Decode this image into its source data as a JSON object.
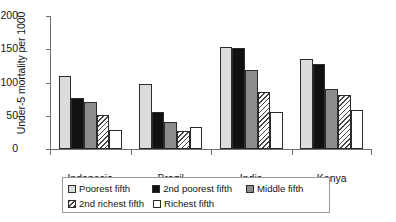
{
  "chart_data": {
    "type": "bar",
    "title": "",
    "xlabel": "",
    "ylabel": "Under-5 mortality per 1000",
    "ylim": [
      0,
      200
    ],
    "yticks": [
      0,
      50,
      100,
      150,
      200
    ],
    "ytick_labels": [
      "0",
      "50",
      "100",
      "150",
      "200"
    ],
    "grid": false,
    "legend_position": "bottom",
    "categories": [
      "Indonesia",
      "Brazil",
      "India",
      "Kenya"
    ],
    "series": [
      {
        "name": "Poorest fifth",
        "color": "#dcdcdc",
        "pattern": "solid-light-gray",
        "values": [
          110,
          98,
          154,
          135
        ]
      },
      {
        "name": "2nd poorest fifth",
        "color": "#111111",
        "pattern": "solid-black",
        "values": [
          76,
          56,
          152,
          128
        ]
      },
      {
        "name": "Middle fifth",
        "color": "#8c8c8c",
        "pattern": "solid-dark-gray",
        "values": [
          70,
          40,
          119,
          90
        ]
      },
      {
        "name": "2nd richest fifth",
        "color": "#ffffff",
        "pattern": "diagonal-hatch",
        "values": [
          51,
          27,
          86,
          81
        ]
      },
      {
        "name": "Richest fifth",
        "color": "#ffffff",
        "pattern": "solid-white",
        "values": [
          29,
          33,
          55,
          58
        ]
      }
    ]
  },
  "legend": {
    "items": [
      {
        "label": "Poorest fifth"
      },
      {
        "label": "2nd poorest fifth"
      },
      {
        "label": "Middle fifth"
      },
      {
        "label": "2nd richest fifth"
      },
      {
        "label": "Richest fifth"
      }
    ]
  }
}
